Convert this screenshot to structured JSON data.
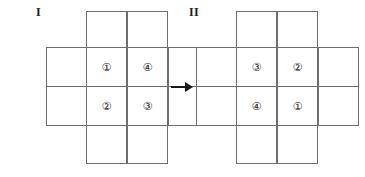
{
  "figures": [
    {
      "label": "I",
      "cells": {
        "top_left": "①",
        "top_right": "④",
        "bottom_left": "②",
        "bottom_right": "③"
      }
    },
    {
      "label": "II",
      "cells": {
        "top_left": "③",
        "top_right": "②",
        "bottom_left": "④",
        "bottom_right": "①"
      }
    }
  ],
  "arrow": {
    "direction": "right",
    "symbol": "→"
  },
  "colors": {
    "grid_line": "#6e6e6e",
    "ink": "#1a1a1a",
    "background": "#ffffff"
  }
}
